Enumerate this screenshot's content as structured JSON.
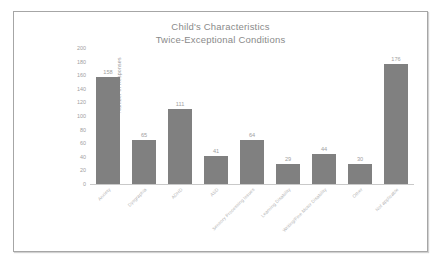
{
  "chart_data": {
    "type": "bar",
    "title": "Child's Characteristics\nTwice-Exceptional Conditions",
    "title_lines": [
      "Child's Characteristics",
      "Twice-Exceptional Conditions"
    ],
    "xlabel": "",
    "ylabel": "Number of Responses",
    "ylim": [
      0,
      200
    ],
    "yticks": [
      200,
      180,
      160,
      140,
      120,
      100,
      80,
      60,
      40,
      20,
      0
    ],
    "grid": false,
    "legend": false,
    "bar_color": "#808080",
    "categories": [
      "Anxiety",
      "Dysgraphia",
      "ADHD",
      "ASD",
      "Sensory Processing Issues",
      "Learning Disability",
      "Writing/Fine Motor Disability",
      "Other",
      "Not applicable"
    ],
    "values": [
      158,
      65,
      111,
      41,
      64,
      29,
      44,
      30,
      176
    ],
    "data_labels": [
      "158",
      "65",
      "111",
      "41",
      "64",
      "29",
      "44",
      "30",
      "176"
    ]
  },
  "frame": {
    "border_color": "#a6a6a6",
    "background": "#ffffff"
  }
}
